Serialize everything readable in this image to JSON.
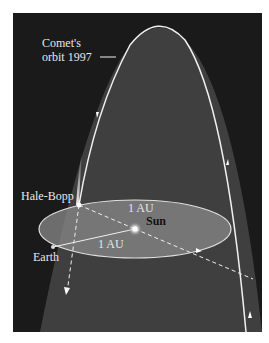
{
  "diagram": {
    "labels": {
      "comet_orbit_line1": "Comet's",
      "comet_orbit_line2": "orbit 1997",
      "comet": "Hale-Bopp",
      "sun": "Sun",
      "earth": "Earth",
      "distance_top": "1 AU",
      "distance_bottom": "1 AU"
    },
    "colors": {
      "background": "#1a1a1a",
      "orbit_interior": "#4a4a4a",
      "earth_orbit_plane": "#8a8a8a",
      "lines": "#f0f0f0"
    }
  }
}
